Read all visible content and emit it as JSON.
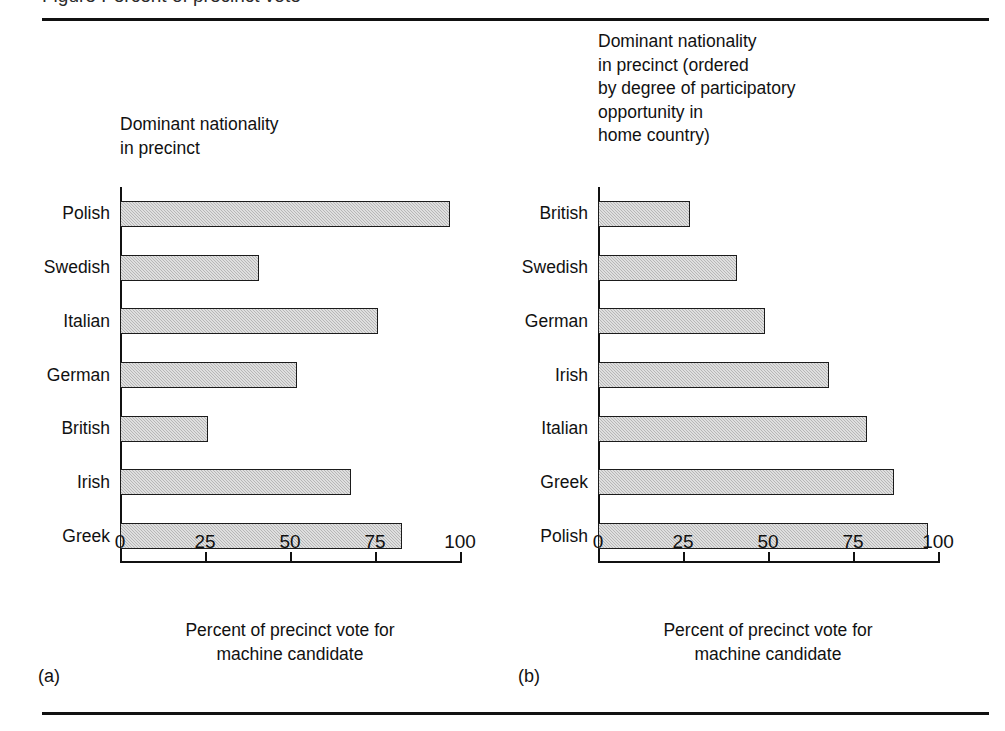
{
  "figure": {
    "caption_cut_off": "Figure   Percent of precinct vote",
    "axis_title": "Percent of precinct vote for\nmachine candidate",
    "colors": {
      "bar_fill": "#b7b7b7",
      "bar_outline": "#1b1b1b",
      "rule": "#111111",
      "text": "#111111"
    }
  },
  "panels": [
    {
      "tag": "(a)",
      "header": "Dominant nationality\nin precinct",
      "axis_title": "Percent of precinct vote for\nmachine candidate"
    },
    {
      "tag": "(b)",
      "header": "Dominant nationality\nin precinct (ordered\nby degree of participatory\nopportunity in\nhome country)",
      "axis_title": "Percent of precinct vote for\nmachine candidate"
    }
  ],
  "chart_data": [
    {
      "type": "bar",
      "orientation": "horizontal",
      "panel": "(a)",
      "title": "Dominant nationality\nin precinct",
      "xlabel": "Percent of precinct vote for machine candidate",
      "ylabel": "Dominant nationality in precinct",
      "xlim": [
        0,
        100
      ],
      "xticks": [
        0,
        25,
        50,
        75,
        100
      ],
      "xtick_labels": [
        "0",
        "25",
        "50",
        "75",
        "100"
      ],
      "grid": false,
      "legend": false,
      "categories": [
        "Polish",
        "Swedish",
        "Italian",
        "German",
        "British",
        "Irish",
        "Greek"
      ],
      "values": [
        97,
        41,
        76,
        52,
        26,
        68,
        83
      ]
    },
    {
      "type": "bar",
      "orientation": "horizontal",
      "panel": "(b)",
      "title": "Dominant nationality\nin precinct (ordered\nby degree of participatory\nopportunity in\nhome country)",
      "xlabel": "Percent of precinct vote for machine candidate",
      "ylabel": "Dominant nationality in precinct (ordered by degree of participatory opportunity in home country)",
      "xlim": [
        0,
        100
      ],
      "xticks": [
        0,
        25,
        50,
        75,
        100
      ],
      "xtick_labels": [
        "0",
        "25",
        "50",
        "75",
        "100"
      ],
      "grid": false,
      "legend": false,
      "categories": [
        "British",
        "Swedish",
        "German",
        "Irish",
        "Italian",
        "Greek",
        "Polish"
      ],
      "values": [
        27,
        41,
        49,
        68,
        79,
        87,
        97
      ]
    }
  ]
}
